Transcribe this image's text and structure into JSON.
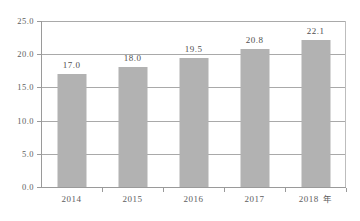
{
  "chart_data": {
    "type": "bar",
    "title": "",
    "subtitle": "",
    "xlabel": "年",
    "ylabel": "",
    "categories": [
      "2014",
      "2015",
      "2016",
      "2017",
      "2018"
    ],
    "values": [
      17.0,
      18.0,
      19.5,
      20.8,
      22.1
    ],
    "data_labels": [
      "17.0",
      "18.0",
      "19.5",
      "20.8",
      "22.1"
    ],
    "ylim": [
      0.0,
      25.0
    ],
    "ytick_step": 5.0,
    "ytick_labels": [
      "0.0",
      "5.0",
      "10.0",
      "15.0",
      "20.0",
      "25.0"
    ],
    "ytick_values": [
      0.0,
      5.0,
      10.0,
      15.0,
      20.0,
      25.0
    ],
    "grid": true,
    "grid_axis": "y",
    "legend": false,
    "legend_position": "none",
    "series": [
      {
        "name": "",
        "values": [
          17.0,
          18.0,
          19.5,
          20.8,
          22.1
        ],
        "color": "#b2b2b2"
      }
    ],
    "colors": {
      "bar": "#b2b2b2",
      "grid": "#a9a9a9",
      "axis": "#9a9a9a",
      "text": "#5e5e5e",
      "background": "#ffffff"
    },
    "axis_unit_suffix": "年"
  }
}
